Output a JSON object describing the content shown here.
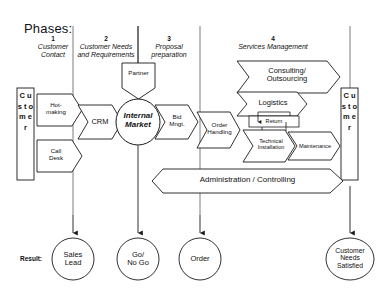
{
  "diagram": {
    "title": "Phases:",
    "result_label": "Result:",
    "stroke_color": "#1a1a1a",
    "fill_color": "#ffffff",
    "background": "#ffffff",
    "phases": [
      {
        "number": "1",
        "name": "Customer\nContact"
      },
      {
        "number": "2",
        "name": "Customer Needs\nand Requirements"
      },
      {
        "number": "3",
        "name": "Proposal\npreparation"
      },
      {
        "number": "4",
        "name": "Services Management"
      }
    ],
    "actors": {
      "left_customer": "C u s t o m e r",
      "right_customer": "C u s t o m e r",
      "left_customer_letters": [
        "C",
        "u",
        "s",
        "t",
        "o",
        "m",
        "e",
        "r"
      ],
      "right_customer_letters": [
        "C",
        "u",
        "s",
        "t",
        "o",
        "m",
        "e",
        "r"
      ]
    },
    "nodes": {
      "hot_making": "Hot-\nmaking",
      "call_desk": "Call\nDesk",
      "crm": "CRM",
      "partner": "Partner",
      "internal_market": "Internal\nMarket",
      "bid_mngt": "Bid\nMngt.",
      "order_handling": "Order\nHandling",
      "consulting_outsourcing": "Consulting/\nOutsourcing",
      "logistics": "Logistics",
      "return": "Return",
      "technical_installation": "Technical\nInstallation",
      "maintenance": "Maintenance",
      "administration_controlling": "Administration / Controlling"
    },
    "results": [
      {
        "label": "Sales\nLead"
      },
      {
        "label": "Go/\nNo Go"
      },
      {
        "label": "Order"
      },
      {
        "label": "Customer\nNeeds\nSatisfied"
      }
    ]
  }
}
